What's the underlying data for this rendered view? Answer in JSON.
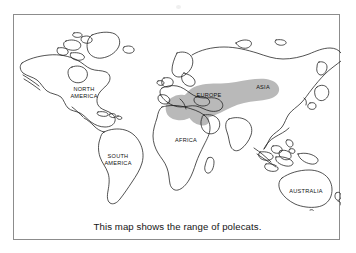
{
  "figure": {
    "caption": "This map shows the range of polecats.",
    "frame_color": "#8c8c8c",
    "background_color": "#ffffff",
    "coastline_color": "#1a1a1a",
    "range_fill_color": "#b9b9b9"
  },
  "map": {
    "labels": [
      {
        "id": "north-america",
        "text": "NORTH\nAMERICA",
        "x": 70,
        "y": 78
      },
      {
        "id": "south-america",
        "text": "SOUTH\nAMERICA",
        "x": 104,
        "y": 145
      },
      {
        "id": "africa",
        "text": "AFRICA",
        "x": 172,
        "y": 126
      },
      {
        "id": "europe",
        "text": "EUROPE",
        "x": 195,
        "y": 81
      },
      {
        "id": "asia",
        "text": "ASIA",
        "x": 249,
        "y": 73
      },
      {
        "id": "australia",
        "text": "AUSTRALIA",
        "x": 292,
        "y": 177
      }
    ],
    "range_region": {
      "name": "polecat-range",
      "description": "Shaded area covering western and central Europe eastward across central Asia",
      "fill": "#b9b9b9"
    }
  }
}
